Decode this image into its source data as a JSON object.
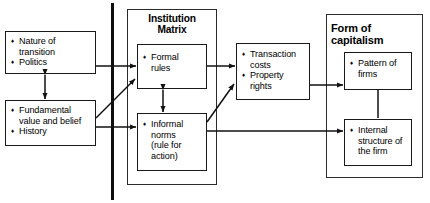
{
  "diagram": {
    "nodes": {
      "nature_transition": {
        "name": "nature-of-transition-box",
        "items": [
          "Nature of",
          "transition",
          "Politics"
        ],
        "bullets": [
          true,
          false,
          true
        ]
      },
      "fundamental_values": {
        "name": "fundamental-value-and-belief-box",
        "items": [
          "Fundamental",
          "value and belief",
          "History"
        ],
        "bullets": [
          true,
          false,
          true
        ]
      },
      "institution_matrix": {
        "title_line1": "Institution",
        "title_line2": "Matrix"
      },
      "formal_rules": {
        "items": [
          "Formal",
          "rules"
        ],
        "bullets": [
          true,
          false
        ]
      },
      "informal_norms": {
        "items": [
          "Informal",
          "norms",
          "(rule for",
          "action)"
        ],
        "bullets": [
          true,
          false,
          false,
          false
        ]
      },
      "transaction_costs": {
        "items": [
          "Transaction",
          "costs",
          "Property",
          "rights"
        ],
        "bullets": [
          true,
          false,
          true,
          false
        ]
      },
      "form_of_capitalism": {
        "title_line1": "Form of",
        "title_line2": "capitalism"
      },
      "pattern_of_firms": {
        "items": [
          "Pattern of",
          "firms"
        ],
        "bullets": [
          true,
          false
        ]
      },
      "internal_structure": {
        "items": [
          "Internal",
          "structure of",
          "the firm"
        ],
        "bullets": [
          true,
          false,
          false
        ]
      }
    },
    "colors": {
      "stroke": "#1a1a1a",
      "text": "#000000",
      "background": "#ffffff",
      "divider": "#0d0d0d"
    }
  }
}
